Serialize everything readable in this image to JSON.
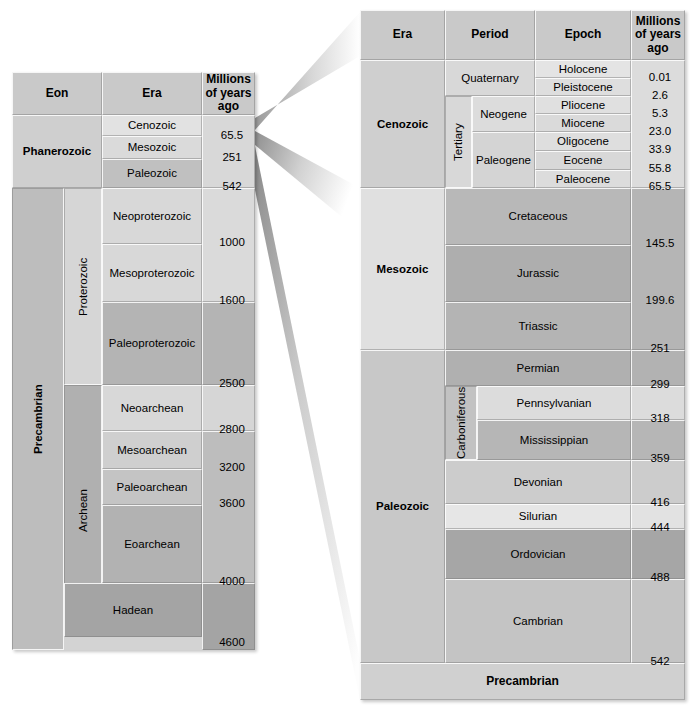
{
  "figure": {
    "type": "geologic-time-scale"
  },
  "left_table": {
    "headers": {
      "eon": "Eon",
      "era": "Era",
      "age": "Millions of years ago"
    },
    "age_header_lines": [
      "Millions",
      "of years",
      "ago"
    ],
    "eons": [
      {
        "name": "Phanerozoic",
        "start": 542,
        "end": 0
      },
      {
        "name": "Precambrian",
        "start": 4600,
        "end": 542
      }
    ],
    "sub_eons": [
      {
        "name": "Proterozoic",
        "start": 2500,
        "end": 542
      },
      {
        "name": "Archean",
        "start": 4000,
        "end": 2500
      }
    ],
    "eras": [
      {
        "name": "Cenozoic",
        "base": 65.5
      },
      {
        "name": "Mesozoic",
        "base": 251
      },
      {
        "name": "Paleozoic",
        "base": 542
      },
      {
        "name": "Neoproterozoic",
        "base": 1000
      },
      {
        "name": "Mesoproterozoic",
        "base": 1600
      },
      {
        "name": "Paleoproterozoic",
        "base": 2500
      },
      {
        "name": "Neoarchean",
        "base": 2800
      },
      {
        "name": "Mesoarchean",
        "base": 3200
      },
      {
        "name": "Paleoarchean",
        "base": 3600
      },
      {
        "name": "Eoarchean",
        "base": 4000
      },
      {
        "name": "Hadean",
        "base": 4600
      }
    ],
    "age_labels": [
      "65.5",
      "251",
      "542",
      "1000",
      "1600",
      "2500",
      "2800",
      "3200",
      "3600",
      "4000",
      "4600"
    ]
  },
  "right_table": {
    "headers": {
      "era": "Era",
      "period": "Period",
      "epoch": "Epoch",
      "age": "Millions of years ago"
    },
    "age_header_lines": [
      "Millions",
      "of years",
      "ago"
    ],
    "eras": [
      {
        "name": "Cenozoic",
        "base": 65.5
      },
      {
        "name": "Mesozoic",
        "base": 251
      },
      {
        "name": "Paleozoic",
        "base": 542
      }
    ],
    "periods": [
      {
        "name": "Quaternary",
        "era": "Cenozoic",
        "base": 2.6
      },
      {
        "name": "Tertiary",
        "era": "Cenozoic",
        "base": 65.5
      },
      {
        "name": "Neogene",
        "era": "Cenozoic",
        "base": 23.0
      },
      {
        "name": "Paleogene",
        "era": "Cenozoic",
        "base": 65.5
      },
      {
        "name": "Cretaceous",
        "era": "Mesozoic",
        "base": 145.5
      },
      {
        "name": "Jurassic",
        "era": "Mesozoic",
        "base": 199.6
      },
      {
        "name": "Triassic",
        "era": "Mesozoic",
        "base": 251
      },
      {
        "name": "Permian",
        "era": "Paleozoic",
        "base": 299
      },
      {
        "name": "Carboniferous",
        "era": "Paleozoic",
        "base": 359
      },
      {
        "name": "Pennsylvanian",
        "era": "Paleozoic",
        "base": 318
      },
      {
        "name": "Mississippian",
        "era": "Paleozoic",
        "base": 359
      },
      {
        "name": "Devonian",
        "era": "Paleozoic",
        "base": 416
      },
      {
        "name": "Silurian",
        "era": "Paleozoic",
        "base": 444
      },
      {
        "name": "Ordovician",
        "era": "Paleozoic",
        "base": 488
      },
      {
        "name": "Cambrian",
        "era": "Paleozoic",
        "base": 542
      }
    ],
    "epochs": [
      {
        "name": "Holocene",
        "base": 0.01
      },
      {
        "name": "Pleistocene",
        "base": 2.6
      },
      {
        "name": "Pliocene",
        "base": 5.3
      },
      {
        "name": "Miocene",
        "base": 23.0
      },
      {
        "name": "Oligocene",
        "base": 33.9
      },
      {
        "name": "Eocene",
        "base": 55.8
      },
      {
        "name": "Paleocene",
        "base": 65.5
      }
    ],
    "footer": "Precambrian",
    "age_labels": [
      "0.01",
      "2.6",
      "5.3",
      "23.0",
      "33.9",
      "55.8",
      "65.5",
      "145.5",
      "199.6",
      "251",
      "299",
      "318",
      "359",
      "416",
      "444",
      "488",
      "542"
    ]
  },
  "colors": {
    "header_fill": "#c9c9c9",
    "light": "#e4e4e4",
    "light2": "#dcdcdc",
    "mid": "#c8c8c8",
    "mid2": "#bdbdbd",
    "dark": "#a8a8a8",
    "darker": "#9c9c9c",
    "text": "#000000"
  }
}
